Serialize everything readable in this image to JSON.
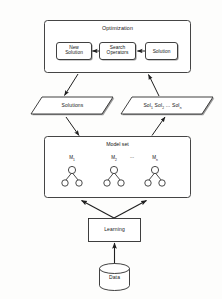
{
  "diagram": {
    "title_optimization": "Optimization",
    "optimization_nodes": [
      {
        "id": "new-solution",
        "label": "New\nSolution"
      },
      {
        "id": "search-operators",
        "label": "Search\nOperators"
      },
      {
        "id": "solution",
        "label": "Solution"
      }
    ],
    "flow_left": {
      "label": "Solutions"
    },
    "flow_right": {
      "label": "Sol  Sol  ...  Sol",
      "items": [
        "Sol",
        "Sol",
        "Sol"
      ],
      "subscripts": [
        "1",
        "2",
        "n"
      ],
      "ellipsis": "..."
    },
    "model_set": {
      "title": "Model set",
      "models": [
        {
          "name": "M",
          "subscript": "1"
        },
        {
          "name": "M",
          "subscript": "2"
        },
        {
          "name": "M",
          "subscript": "n"
        }
      ],
      "separator": "..."
    },
    "learning": {
      "label": "Learning"
    },
    "data_store": {
      "label": "Data"
    },
    "colors": {
      "stroke": "#262626",
      "fill": "#ffffff",
      "shadow": "#8f8f8f",
      "text": "#161616"
    }
  }
}
